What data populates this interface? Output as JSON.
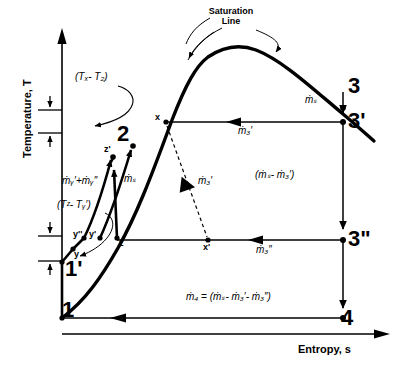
{
  "figure": {
    "type": "thermodynamic-ts-diagram",
    "title_visible": false,
    "background": "#ffffff",
    "ink": "#000000"
  },
  "axes": {
    "y_label": "Temperature, T",
    "x_label": "Entropy, s",
    "y_arrow": "up",
    "x_arrow": "right",
    "origin_px": [
      62,
      318
    ]
  },
  "annotations": {
    "saturation_line": "Saturation\nLine",
    "saturation_line_text_1": "Saturation",
    "saturation_line_text_2": "Line",
    "delta_tx_t2": "(Tₓ- T₂)",
    "delta_tz_ty": "(Tᶻ- Tᵧ′)"
  },
  "state_points": [
    {
      "id": "1",
      "label": "1",
      "size": "big",
      "x": 62,
      "y": 318
    },
    {
      "id": "1p",
      "label": "1'",
      "size": "big",
      "x": 62,
      "y": 264
    },
    {
      "id": "y",
      "label": "y",
      "size": "small",
      "x": 73,
      "y": 251
    },
    {
      "id": "ypp",
      "label": "y''",
      "size": "small",
      "x": 82,
      "y": 240
    },
    {
      "id": "yp",
      "label": "y'",
      "size": "small",
      "x": 96,
      "y": 240
    },
    {
      "id": "z",
      "label": "z",
      "size": "small",
      "x": 117,
      "y": 240
    },
    {
      "id": "zp",
      "label": "z'",
      "size": "small",
      "x": 113,
      "y": 157
    },
    {
      "id": "2",
      "label": "2",
      "size": "big",
      "x": 134,
      "y": 146
    },
    {
      "id": "x",
      "label": "x",
      "size": "small",
      "x": 164,
      "y": 122
    },
    {
      "id": "xp",
      "label": "x'",
      "size": "small",
      "x": 206,
      "y": 240
    },
    {
      "id": "3",
      "label": "3",
      "size": "big",
      "x": 343,
      "y": 91
    },
    {
      "id": "3p",
      "label": "3'",
      "size": "big",
      "x": 343,
      "y": 122
    },
    {
      "id": "3pp",
      "label": "3\"",
      "size": "big",
      "x": 343,
      "y": 240
    },
    {
      "id": "4",
      "label": "4",
      "size": "big",
      "x": 343,
      "y": 318
    }
  ],
  "flow_labels": [
    {
      "id": "m-s-top",
      "text": "ṁₛ",
      "x": 308,
      "y": 100
    },
    {
      "id": "m-3p",
      "text": "ṁ₃′",
      "x": 243,
      "y": 129
    },
    {
      "id": "m-3p-dashed",
      "text": "ṁ₃′",
      "x": 203,
      "y": 180
    },
    {
      "id": "m-s-minus",
      "text": "(ṁₛ- ṁ₃′)",
      "x": 262,
      "y": 175
    },
    {
      "id": "m-3pp",
      "text": "ṁ₃″",
      "x": 263,
      "y": 248
    },
    {
      "id": "m-4",
      "text": "ṁ₄ = (ṁₛ- ṁ₃′- ṁ₃″)",
      "x": 196,
      "y": 298
    },
    {
      "id": "m-y-sum",
      "text": "ṁᵧ′+ṁᵧ″",
      "x": 88,
      "y": 180
    },
    {
      "id": "m-s-left",
      "text": "ṁₛ",
      "x": 128,
      "y": 178
    }
  ],
  "lines": {
    "saturation_curve": "bold curve rising from near 1 through z, x, peak, then descending right past 3",
    "compression_1_to_2": "1' -> y -> y'' -> y' -> z -> z' -> 2 bold arrowed paths",
    "iso_line_3p_to_x": "horizontal line from 3' leftwards to x with left arrow",
    "iso_line_3pp_to_xp": "horizontal line from 3'' leftwards through x' to z with left arrow",
    "iso_line_4_to_1": "horizontal line from 4 leftwards to 1 with left arrow",
    "vertical_3_to_3p": "downward arrow from 3 to 3'",
    "vertical_3p_to_3pp": "downward arrow from 3' to 3''",
    "vertical_3pp_to_4": "downward arrow from 3'' to 4",
    "dashed_x_to_xp": "dashed line with arrow from x down-right to x'"
  },
  "tick_marks": {
    "delta_tx_t2_top_y": 108,
    "delta_tx_t2_bottom_y": 132,
    "delta_tz_ty_top_y": 233,
    "delta_tz_ty_bottom_y": 258
  }
}
